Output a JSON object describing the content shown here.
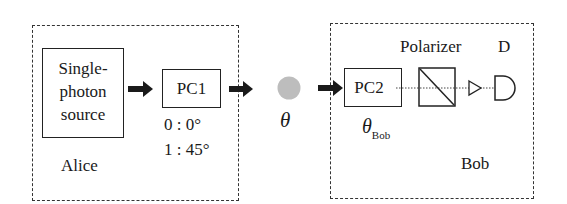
{
  "alice": {
    "label": "Alice",
    "source": {
      "line1": "Single-",
      "line2": "photon",
      "line3": "source"
    },
    "pc1": {
      "label": "PC1",
      "setting0": "0 : 0°",
      "setting1": "1 : 45°"
    }
  },
  "channel": {
    "photon_label": "θ",
    "photon_color": "#bdbdbd"
  },
  "bob": {
    "label": "Bob",
    "pc2": {
      "label": "PC2",
      "angle_symbol": "θ",
      "angle_subscript": "Bob"
    },
    "polarizer_label": "Polarizer",
    "detector_label": "D"
  }
}
